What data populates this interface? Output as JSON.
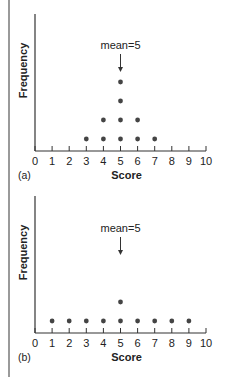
{
  "chart_data": [
    {
      "type": "scatter",
      "subtype": "dot-plot",
      "panel_label": "(a)",
      "xlabel": "Score",
      "ylabel": "Frequency",
      "x_ticks": [
        0,
        1,
        2,
        3,
        4,
        5,
        6,
        7,
        8,
        9,
        10
      ],
      "xlim": [
        0,
        10
      ],
      "annotation": "mean=5",
      "annotation_x": 5,
      "frequencies": [
        {
          "score": 3,
          "count": 1
        },
        {
          "score": 4,
          "count": 2
        },
        {
          "score": 5,
          "count": 4
        },
        {
          "score": 6,
          "count": 2
        },
        {
          "score": 7,
          "count": 1
        }
      ]
    },
    {
      "type": "scatter",
      "subtype": "dot-plot",
      "panel_label": "(b)",
      "xlabel": "Score",
      "ylabel": "Frequency",
      "x_ticks": [
        0,
        1,
        2,
        3,
        4,
        5,
        6,
        7,
        8,
        9,
        10
      ],
      "xlim": [
        0,
        10
      ],
      "annotation": "mean=5",
      "annotation_x": 5,
      "frequencies": [
        {
          "score": 1,
          "count": 1
        },
        {
          "score": 2,
          "count": 1
        },
        {
          "score": 3,
          "count": 1
        },
        {
          "score": 4,
          "count": 1
        },
        {
          "score": 5,
          "count": 2
        },
        {
          "score": 6,
          "count": 1
        },
        {
          "score": 7,
          "count": 1
        },
        {
          "score": 8,
          "count": 1
        },
        {
          "score": 9,
          "count": 1
        }
      ]
    }
  ],
  "colors": {
    "axis": "#333333",
    "dot": "#444444",
    "border": "#9a9a9a"
  }
}
